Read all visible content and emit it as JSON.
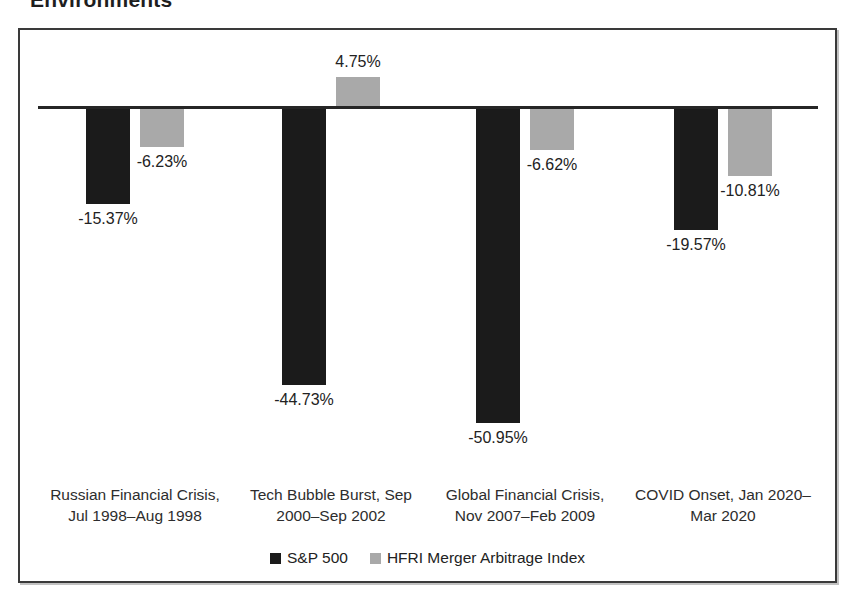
{
  "page": {
    "title_fragment": "Environments"
  },
  "chart_data": {
    "type": "bar",
    "title": "Environments",
    "categories": [
      "Russian Financial Crisis, Jul 1998–Aug 1998",
      "Tech Bubble Burst, Sep 2000–Sep 2002",
      "Global Financial Crisis, Nov 2007–Feb 2009",
      "COVID Onset, Jan 2020–Mar 2020"
    ],
    "category_lines": [
      [
        "Russian Financial Crisis,",
        "Jul 1998–Aug 1998"
      ],
      [
        "Tech Bubble Burst, Sep",
        "2000–Sep 2002"
      ],
      [
        "Global Financial Crisis,",
        "Nov 2007–Feb 2009"
      ],
      [
        "COVID Onset, Jan 2020–",
        "Mar 2020"
      ]
    ],
    "series": [
      {
        "name": "S&P 500",
        "color": "#1b1b1b",
        "values": [
          -15.37,
          -44.73,
          -50.95,
          -19.57
        ],
        "labels": [
          "-15.37%",
          "-44.73%",
          "-50.95%",
          "-19.57%"
        ]
      },
      {
        "name": "HFRI Merger Arbitrage Index",
        "color": "#a9a9a9",
        "values": [
          -6.23,
          4.75,
          -6.62,
          -10.81
        ],
        "labels": [
          "-6.23%",
          "4.75%",
          "-6.62%",
          "-10.81%"
        ]
      }
    ],
    "ylim": [
      -55,
      8
    ],
    "xlabel": "",
    "ylabel": "",
    "grid": false,
    "legend_position": "bottom"
  }
}
